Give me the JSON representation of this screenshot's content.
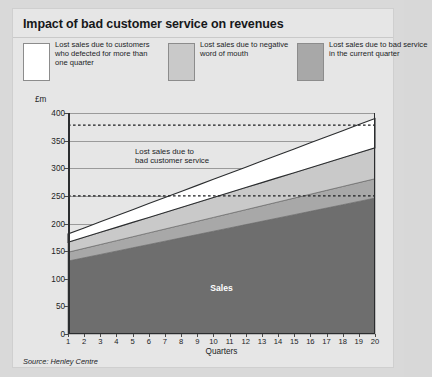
{
  "panel": {
    "title": "Impact of bad customer service on revenues",
    "source": "Source: Henley Centre"
  },
  "legend": [
    {
      "label": "Lost sales due to customers who defected for more than one quarter",
      "color": "#ffffff",
      "name": "legend-defected"
    },
    {
      "label": "Lost sales due to negative word of mouth",
      "color": "#c9c9c9",
      "name": "legend-word-of-mouth"
    },
    {
      "label": "Lost sales due to bad service in the current quarter",
      "color": "#a8a8a8",
      "name": "legend-bad-service"
    }
  ],
  "annotation": "Lost sales due to bad customer service",
  "sales_label": "Sales",
  "chart_data": {
    "type": "area",
    "title": "Impact of bad customer service on revenues",
    "xlabel": "Quarters",
    "ylabel": "£m",
    "ylim": [
      0,
      400
    ],
    "xlim": [
      1,
      20
    ],
    "yticks": [
      0,
      50,
      100,
      150,
      200,
      250,
      300,
      350,
      400
    ],
    "grid": true,
    "legend_position": "top",
    "categories": [
      1,
      2,
      3,
      4,
      5,
      6,
      7,
      8,
      9,
      10,
      11,
      12,
      13,
      14,
      15,
      16,
      17,
      18,
      19,
      20
    ],
    "stacking": "stacked",
    "series": [
      {
        "name": "Sales",
        "color": "#6e6e6e",
        "values": [
          132,
          138,
          144,
          150,
          156,
          162,
          168,
          174,
          180,
          186,
          192,
          198,
          204,
          210,
          216,
          222,
          228,
          234,
          240,
          246
        ]
      },
      {
        "name": "Lost sales due to bad service in the current quarter",
        "color": "#a8a8a8",
        "values": [
          16,
          17,
          18,
          19,
          20,
          21,
          22,
          23,
          24,
          25,
          26,
          27,
          28,
          29,
          30,
          31,
          32,
          33,
          34,
          35
        ]
      },
      {
        "name": "Lost sales due to negative word of mouth",
        "color": "#c9c9c9",
        "values": [
          18,
          20,
          22,
          24,
          26,
          28,
          30,
          32,
          34,
          36,
          38,
          40,
          42,
          44,
          46,
          48,
          50,
          52,
          54,
          56
        ]
      },
      {
        "name": "Lost sales due to customers who defected for more than one quarter",
        "color": "#ffffff",
        "values": [
          15,
          17,
          19,
          21,
          23,
          25,
          27,
          29,
          31,
          33,
          35,
          37,
          39,
          41,
          43,
          45,
          47,
          49,
          51,
          53
        ]
      }
    ],
    "reference_lines": [
      {
        "name": "total-potential-revenue",
        "value": 378,
        "style": "dashed"
      },
      {
        "name": "actual-sales-level",
        "value": 250,
        "style": "dashed"
      }
    ]
  }
}
